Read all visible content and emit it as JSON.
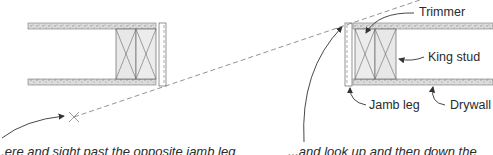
{
  "labels": {
    "trimmer": "Trimmer",
    "king_stud": "King stud",
    "jamb_leg": "Jamb leg",
    "drywall": "Drywall"
  },
  "captions": {
    "left": "...ere and sight past the opposite jamb leg",
    "right": "...and look up and then down the"
  },
  "colors": {
    "line": "#555555",
    "drywall_fill": "#d8d8d8",
    "stud_fill": "#e6e6e6",
    "text": "#2a2a2a"
  }
}
